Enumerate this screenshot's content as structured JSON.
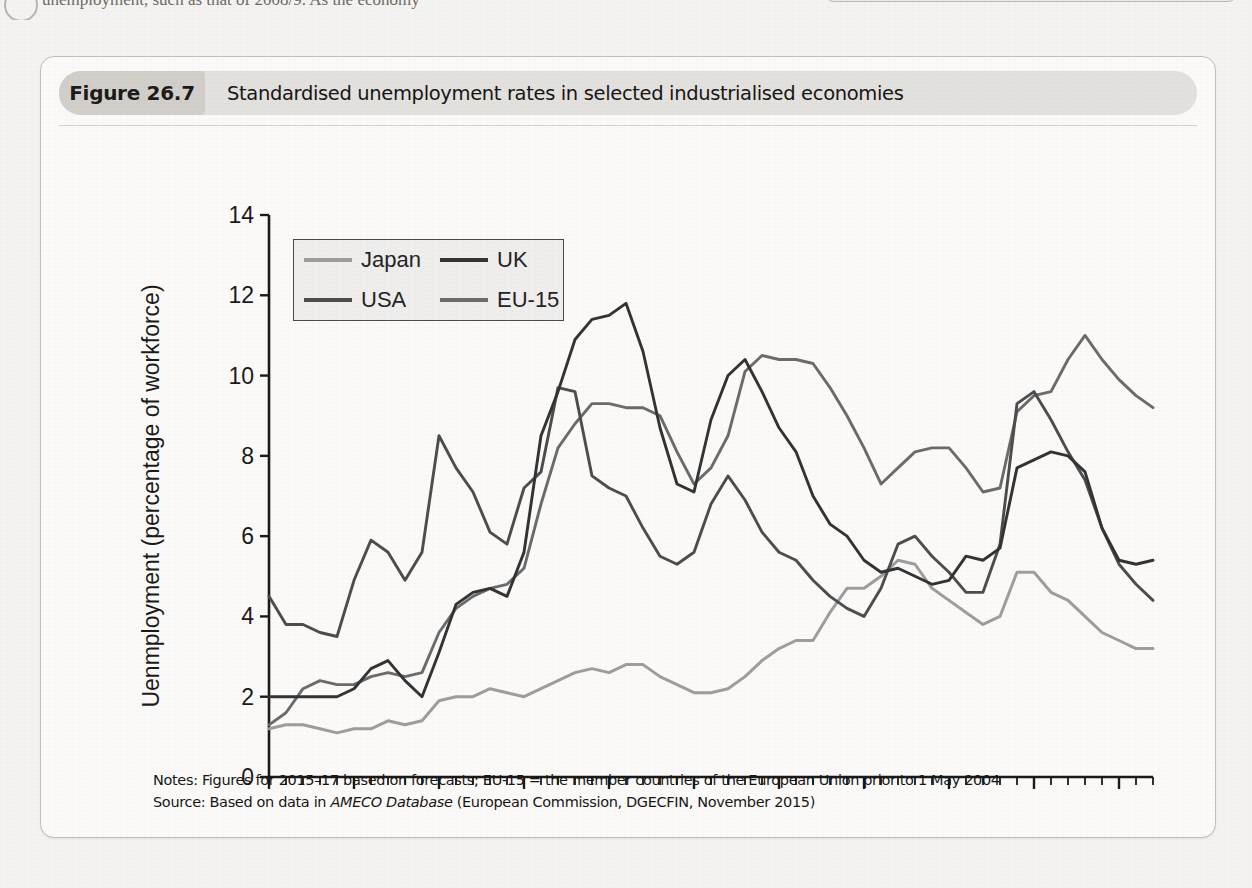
{
  "page_bleed": {
    "text": "unemployment, such as that of 2008/9. As the economy"
  },
  "figure": {
    "badge": "Figure 26.7",
    "title": "Standardised unemployment rates in selected industrialised economies"
  },
  "legend": {
    "items": [
      {
        "label": "Japan",
        "color": "#9d9d9d"
      },
      {
        "label": "UK",
        "color": "#333333"
      },
      {
        "label": "USA",
        "color": "#4d4d4d"
      },
      {
        "label": "EU-15",
        "color": "#6b6b6b"
      }
    ]
  },
  "notes": {
    "line1_pre": "Notes: Figures for 2015–17 based on forecasts; EU-15 = the member countries of the European Union prior to 1 May 2004",
    "line2_pre": "Source: Based on data in ",
    "line2_italic": "AMECO Database",
    "line2_post": " (European Commission, DGECFIN, November 2015)"
  },
  "chart_data": {
    "type": "line",
    "title": "Standardised unemployment rates in selected industrialised economies",
    "xlabel": "",
    "ylabel": "Uenmployment (percentage of workforce)",
    "xlim": [
      1965,
      2017
    ],
    "ylim": [
      0,
      14
    ],
    "ytick_step": 2,
    "yticks": [
      0,
      2,
      4,
      6,
      8,
      10,
      12,
      14
    ],
    "xticks": [
      1965,
      1970,
      1975,
      1980,
      1985,
      1990,
      1995,
      2000,
      2005,
      2010,
      2015
    ],
    "xminor_step": 1,
    "grid": false,
    "legend_position": "upper-left-inside",
    "x": [
      1965,
      1966,
      1967,
      1968,
      1969,
      1970,
      1971,
      1972,
      1973,
      1974,
      1975,
      1976,
      1977,
      1978,
      1979,
      1980,
      1981,
      1982,
      1983,
      1984,
      1985,
      1986,
      1987,
      1988,
      1989,
      1990,
      1991,
      1992,
      1993,
      1994,
      1995,
      1996,
      1997,
      1998,
      1999,
      2000,
      2001,
      2002,
      2003,
      2004,
      2005,
      2006,
      2007,
      2008,
      2009,
      2010,
      2011,
      2012,
      2013,
      2014,
      2015,
      2016,
      2017
    ],
    "series": [
      {
        "name": "Japan",
        "color": "#9d9d9d",
        "values": [
          1.2,
          1.3,
          1.3,
          1.2,
          1.1,
          1.2,
          1.2,
          1.4,
          1.3,
          1.4,
          1.9,
          2.0,
          2.0,
          2.2,
          2.1,
          2.0,
          2.2,
          2.4,
          2.6,
          2.7,
          2.6,
          2.8,
          2.8,
          2.5,
          2.3,
          2.1,
          2.1,
          2.2,
          2.5,
          2.9,
          3.2,
          3.4,
          3.4,
          4.1,
          4.7,
          4.7,
          5.0,
          5.4,
          5.3,
          4.7,
          4.4,
          4.1,
          3.8,
          4.0,
          5.1,
          5.1,
          4.6,
          4.4,
          4.0,
          3.6,
          3.4,
          3.2,
          3.2
        ]
      },
      {
        "name": "UK",
        "color": "#333333",
        "values": [
          2.0,
          2.0,
          2.0,
          2.0,
          2.0,
          2.2,
          2.7,
          2.9,
          2.4,
          2.0,
          3.1,
          4.3,
          4.6,
          4.7,
          4.5,
          5.6,
          8.5,
          9.6,
          10.9,
          11.4,
          11.5,
          11.8,
          10.6,
          8.7,
          7.3,
          7.1,
          8.9,
          10.0,
          10.4,
          9.6,
          8.7,
          8.1,
          7.0,
          6.3,
          6.0,
          5.4,
          5.1,
          5.2,
          5.0,
          4.8,
          4.9,
          5.5,
          5.4,
          5.7,
          7.7,
          7.9,
          8.1,
          8.0,
          7.6,
          6.2,
          5.4,
          5.3,
          5.4
        ]
      },
      {
        "name": "USA",
        "color": "#4d4d4d",
        "values": [
          4.5,
          3.8,
          3.8,
          3.6,
          3.5,
          4.9,
          5.9,
          5.6,
          4.9,
          5.6,
          8.5,
          7.7,
          7.1,
          6.1,
          5.8,
          7.2,
          7.6,
          9.7,
          9.6,
          7.5,
          7.2,
          7.0,
          6.2,
          5.5,
          5.3,
          5.6,
          6.8,
          7.5,
          6.9,
          6.1,
          5.6,
          5.4,
          4.9,
          4.5,
          4.2,
          4.0,
          4.7,
          5.8,
          6.0,
          5.5,
          5.1,
          4.6,
          4.6,
          5.8,
          9.3,
          9.6,
          8.9,
          8.1,
          7.4,
          6.2,
          5.3,
          4.8,
          4.4
        ]
      },
      {
        "name": "EU-15",
        "color": "#6b6b6b",
        "values": [
          1.3,
          1.6,
          2.2,
          2.4,
          2.3,
          2.3,
          2.5,
          2.6,
          2.5,
          2.6,
          3.6,
          4.2,
          4.5,
          4.7,
          4.8,
          5.2,
          6.8,
          8.2,
          8.8,
          9.3,
          9.3,
          9.2,
          9.2,
          9.0,
          8.1,
          7.3,
          7.7,
          8.5,
          10.1,
          10.5,
          10.4,
          10.4,
          10.3,
          9.7,
          9.0,
          8.2,
          7.3,
          7.7,
          8.1,
          8.2,
          8.2,
          7.7,
          7.1,
          7.2,
          9.1,
          9.5,
          9.6,
          10.4,
          11.0,
          10.4,
          9.9,
          9.5,
          9.2
        ]
      }
    ]
  }
}
